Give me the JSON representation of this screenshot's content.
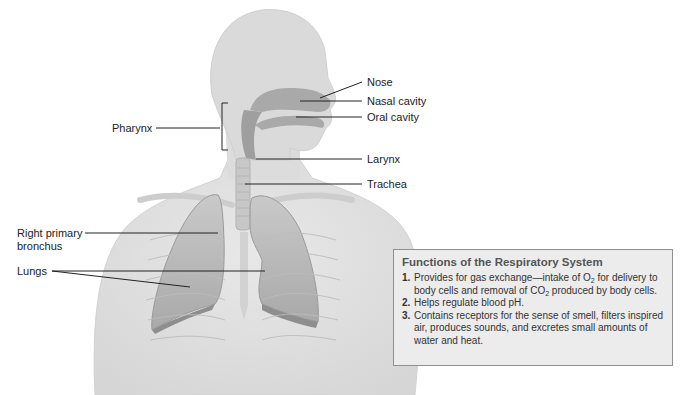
{
  "diagram": {
    "labels": [
      {
        "id": "nose",
        "text": "Nose"
      },
      {
        "id": "nasal-cavity",
        "text": "Nasal cavity"
      },
      {
        "id": "oral-cavity",
        "text": "Oral cavity"
      },
      {
        "id": "pharynx",
        "text": "Pharynx"
      },
      {
        "id": "larynx",
        "text": "Larynx"
      },
      {
        "id": "trachea",
        "text": "Trachea"
      },
      {
        "id": "right-primary-bronchus-line1",
        "text": "Right primary"
      },
      {
        "id": "right-primary-bronchus-line2",
        "text": "bronchus"
      },
      {
        "id": "lungs",
        "text": "Lungs"
      }
    ],
    "colors": {
      "body": "#e3e3e3",
      "body_edge": "#cfcfcf",
      "cavity": "#a9a9a9",
      "lung": "#b9b9b9",
      "lung_dark": "#8e8e8e",
      "leader_line": "#222222",
      "box_bg": "#ececec",
      "box_border": "#8f8f8f"
    }
  },
  "functions_box": {
    "title": "Functions of the Respiratory System",
    "items": [
      {
        "num": "1.",
        "parts": [
          "Provides for gas exchange—intake of O",
          "2",
          " for delivery to body cells and removal of CO",
          "2",
          " produced by body cells."
        ]
      },
      {
        "num": "2.",
        "text": "Helps regulate blood pH."
      },
      {
        "num": "3.",
        "text": "Contains receptors for the sense of smell, filters inspired air, produces sounds, and excretes small amounts of water and heat."
      }
    ]
  }
}
